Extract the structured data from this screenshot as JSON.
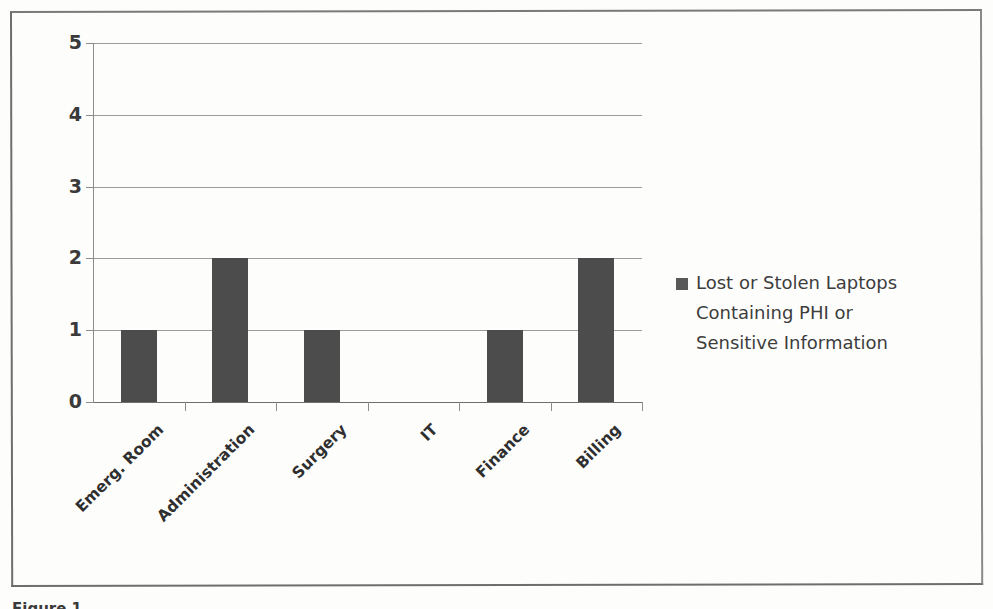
{
  "figure": {
    "caption_fragment": "Figure 1."
  },
  "chart_data": {
    "type": "bar",
    "title": "",
    "subtitle": "",
    "xlabel": "",
    "ylabel": "",
    "categories": [
      "Emerg. Room",
      "Administration",
      "Surgery",
      "IT",
      "Finance",
      "Billing"
    ],
    "values": [
      1,
      2,
      1,
      0,
      1,
      2
    ],
    "series": [
      {
        "name": "Lost or Stolen Laptops Containing PHI or Sensitive Information",
        "values": [
          1,
          2,
          1,
          0,
          1,
          2
        ]
      }
    ],
    "ylim": [
      0,
      5
    ],
    "y_ticks": [
      "0",
      "1",
      "2",
      "3",
      "4",
      "5"
    ],
    "grid": true,
    "legend_position": "right",
    "bar_color": "#4c4c4c",
    "gridline_color": "#9b9b9b",
    "axis_color": "#8d8d8d"
  },
  "legend": {
    "swatch_color": "#595959",
    "lines": [
      "Lost or Stolen Laptops",
      "Containing PHI or",
      "Sensitive Information"
    ]
  },
  "axis": {
    "y_labels": [
      "5",
      "4",
      "3",
      "2",
      "1",
      "0"
    ]
  }
}
